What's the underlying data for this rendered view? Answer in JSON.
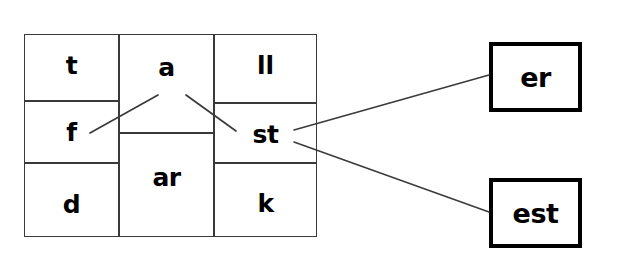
{
  "diagram": {
    "background_color": "#ffffff",
    "line_color": "#3a3a3a",
    "text_color": "#000000",
    "box_border_color": "#000000"
  },
  "grid": {
    "columns": [
      {
        "name": "onset-column",
        "cells": [
          {
            "id": "cell-t",
            "label": "t"
          },
          {
            "id": "cell-f",
            "label": "f"
          },
          {
            "id": "cell-d",
            "label": "d"
          }
        ]
      },
      {
        "name": "vowel-column",
        "cells": [
          {
            "id": "cell-a",
            "label": "a"
          },
          {
            "id": "cell-ar",
            "label": "ar"
          }
        ]
      },
      {
        "name": "rime-column",
        "cells": [
          {
            "id": "cell-ll",
            "label": "ll"
          },
          {
            "id": "cell-st",
            "label": "st"
          },
          {
            "id": "cell-k",
            "label": "k"
          }
        ]
      }
    ]
  },
  "suffix_boxes": [
    {
      "id": "box-er",
      "label": "er"
    },
    {
      "id": "box-est",
      "label": "est"
    }
  ],
  "connectors": [
    {
      "id": "line-a-to-f",
      "from": "a",
      "to": "f",
      "x1": 158,
      "y1": 95,
      "x2": 90,
      "y2": 133
    },
    {
      "id": "line-a-to-st",
      "from": "a",
      "to": "st",
      "x1": 186,
      "y1": 95,
      "x2": 236,
      "y2": 131
    },
    {
      "id": "line-st-to-er",
      "from": "st",
      "to": "er",
      "x1": 294,
      "y1": 130,
      "x2": 489,
      "y2": 75
    },
    {
      "id": "line-st-to-est",
      "from": "st",
      "to": "est",
      "x1": 294,
      "y1": 142,
      "x2": 489,
      "y2": 212
    }
  ]
}
